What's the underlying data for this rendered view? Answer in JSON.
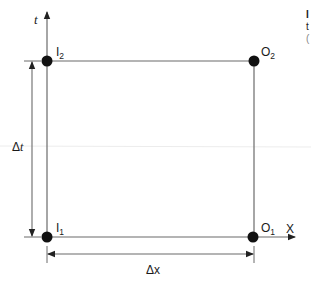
{
  "diagram": {
    "type": "spacetime-rectangle",
    "axes": {
      "vertical": {
        "label": "t"
      },
      "horizontal": {
        "label": "X"
      }
    },
    "points": [
      {
        "id": "I1",
        "base": "I",
        "sub": "1"
      },
      {
        "id": "I2",
        "base": "I",
        "sub": "2"
      },
      {
        "id": "O1",
        "base": "O",
        "sub": "1"
      },
      {
        "id": "O2",
        "base": "O",
        "sub": "2"
      }
    ],
    "dimensions": {
      "delta_t": {
        "label": "Δt",
        "delta": "Δ",
        "var": "t"
      },
      "delta_x": {
        "label": "Δx"
      }
    },
    "cropped_text_fragments": [
      "I",
      "t",
      "("
    ]
  },
  "colors": {
    "line": "#6b6b6b",
    "dot": "#111111",
    "text": "#1a1a1a",
    "background": "#ffffff"
  }
}
